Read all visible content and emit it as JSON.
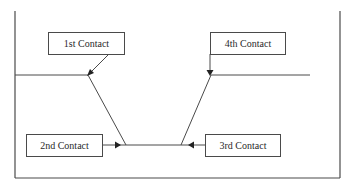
{
  "diagram": {
    "type": "contact-flow",
    "frame": {
      "top_border_color": "#5a9e6f",
      "border_color": "#4a4a4a"
    },
    "boxes": [
      {
        "id": "first",
        "label": "1st Contact"
      },
      {
        "id": "second",
        "label": "2nd Contact"
      },
      {
        "id": "third",
        "label": "3rd Contact"
      },
      {
        "id": "fourth",
        "label": "4th Contact"
      }
    ]
  }
}
